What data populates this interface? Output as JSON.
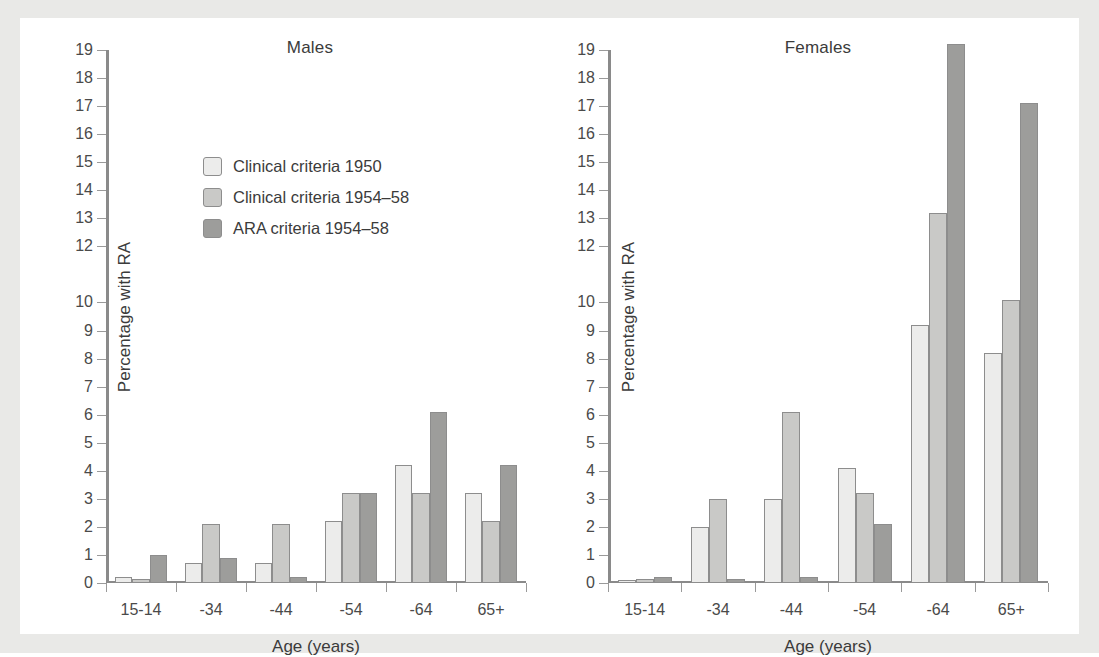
{
  "figure": {
    "background_color": "#e9e9e7",
    "plate_color": "#ffffff"
  },
  "legend": {
    "entries": [
      {
        "label": "Clinical criteria 1950",
        "color": "#ececeb",
        "key": "clinical-1950"
      },
      {
        "label": "Clinical criteria 1954–58",
        "color": "#c9c9c7",
        "key": "clinical-1954-58"
      },
      {
        "label": "ARA criteria 1954–58",
        "color": "#9d9d9b",
        "key": "ara-1954-58"
      }
    ]
  },
  "chart_data": [
    {
      "type": "bar",
      "title": "Males",
      "xlabel": "Age (years)",
      "ylabel": "Percentage with RA",
      "categories": [
        "15-14",
        "-34",
        "-44",
        "-54",
        "-64",
        "65+"
      ],
      "ylim": [
        0,
        19
      ],
      "yticks": [
        0,
        1,
        2,
        3,
        4,
        5,
        6,
        7,
        8,
        9,
        10,
        12,
        13,
        14,
        15,
        16,
        17,
        18,
        19
      ],
      "ytick_labels": [
        "0",
        "1",
        "2",
        "3",
        "4",
        "5",
        "6",
        "7",
        "8",
        "9",
        "10",
        "12",
        "13",
        "14",
        "15",
        "16",
        "17",
        "18",
        "19"
      ],
      "grid": false,
      "legend_position": "upper-left-inside",
      "series": [
        {
          "name": "Clinical criteria 1950",
          "values": [
            0.2,
            0.7,
            0.7,
            2.2,
            4.2,
            3.2
          ]
        },
        {
          "name": "Clinical criteria 1954–58",
          "values": [
            0.15,
            2.1,
            2.1,
            3.2,
            3.2,
            2.2
          ]
        },
        {
          "name": "ARA criteria 1954–58",
          "values": [
            1.0,
            0.9,
            0.2,
            3.2,
            6.1,
            4.2
          ]
        }
      ]
    },
    {
      "type": "bar",
      "title": "Females",
      "xlabel": "Age (years)",
      "ylabel": "Percentage with RA",
      "categories": [
        "15-14",
        "-34",
        "-44",
        "-54",
        "-64",
        "65+"
      ],
      "ylim": [
        0,
        19
      ],
      "yticks": [
        0,
        1,
        2,
        3,
        4,
        5,
        6,
        7,
        8,
        9,
        10,
        12,
        13,
        14,
        15,
        16,
        17,
        18,
        19
      ],
      "ytick_labels": [
        "0",
        "1",
        "2",
        "3",
        "4",
        "5",
        "6",
        "7",
        "8",
        "9",
        "10",
        "12",
        "13",
        "14",
        "15",
        "16",
        "17",
        "18",
        "19"
      ],
      "grid": false,
      "legend_position": "none",
      "series": [
        {
          "name": "Clinical criteria 1950",
          "values": [
            0.1,
            2.0,
            3.0,
            4.1,
            9.2,
            8.2
          ]
        },
        {
          "name": "Clinical criteria 1954–58",
          "values": [
            0.15,
            3.0,
            6.1,
            3.2,
            13.2,
            10.1
          ]
        },
        {
          "name": "ARA criteria 1954–58",
          "values": [
            0.2,
            0.15,
            0.2,
            2.1,
            19.2,
            17.1
          ]
        }
      ]
    }
  ]
}
